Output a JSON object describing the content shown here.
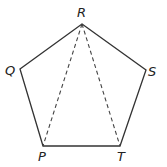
{
  "figure": {
    "shape": "pentagon",
    "vertices": [
      {
        "label": "R",
        "x": 82,
        "y": 24
      },
      {
        "label": "S",
        "x": 146,
        "y": 70
      },
      {
        "label": "T",
        "x": 120,
        "y": 146
      },
      {
        "label": "P",
        "x": 43,
        "y": 146
      },
      {
        "label": "Q",
        "x": 20,
        "y": 69
      }
    ],
    "solid_edges": [
      "RS",
      "ST",
      "TP",
      "PQ",
      "QR"
    ],
    "dashed_segments": [
      "RP",
      "RT"
    ],
    "labels": {
      "R": "R",
      "S": "S",
      "T": "T",
      "P": "P",
      "Q": "Q"
    },
    "colors": {
      "line": "#333333",
      "text": "#222222",
      "background": "#ffffff"
    }
  }
}
